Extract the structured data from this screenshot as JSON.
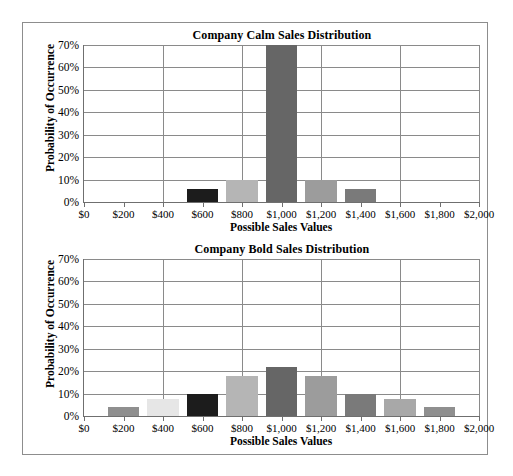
{
  "figure": {
    "background": "#ffffff",
    "frame_color": "#8d8d8d"
  },
  "charts": [
    {
      "id": "company-calm",
      "chart_data": {
        "type": "bar",
        "title": "Company Calm Sales Distribution",
        "xlabel": "Possible Sales Values",
        "ylabel": "Probability of Occurrence",
        "categories": [
          "$0",
          "$200",
          "$400",
          "$600",
          "$800",
          "$1,000",
          "$1,200",
          "$1,400",
          "$1,600",
          "$1,800",
          "$2,000"
        ],
        "x_values": [
          0,
          200,
          400,
          600,
          800,
          1000,
          1200,
          1400,
          1600,
          1800,
          2000
        ],
        "values": [
          0,
          0,
          0,
          0.06,
          0.1,
          0.7,
          0.1,
          0.06,
          0,
          0,
          0
        ],
        "value_labels": [
          "0%",
          "0%",
          "0%",
          "6%",
          "10%",
          "70%",
          "10%",
          "6%",
          "0%",
          "0%",
          "0%"
        ],
        "bar_colors": [
          "",
          "",
          "",
          "#1c1c1c",
          "#b5b5b5",
          "#666666",
          "#9c9c9c",
          "#7a7a7a",
          "",
          "",
          ""
        ],
        "ylim": [
          0,
          0.7
        ],
        "ytick_labels": [
          "0%",
          "10%",
          "20%",
          "30%",
          "40%",
          "50%",
          "60%",
          "70%"
        ],
        "ytick_values": [
          0,
          0.1,
          0.2,
          0.3,
          0.4,
          0.5,
          0.6,
          0.7
        ],
        "grid": true,
        "legend": "none"
      }
    },
    {
      "id": "company-bold",
      "chart_data": {
        "type": "bar",
        "title": "Company Bold Sales Distribution",
        "xlabel": "Possible Sales Values",
        "ylabel": "Probability of Occurrence",
        "categories": [
          "$0",
          "$200",
          "$400",
          "$600",
          "$800",
          "$1,000",
          "$1,200",
          "$1,400",
          "$1,600",
          "$1,800",
          "$2,000"
        ],
        "x_values": [
          0,
          200,
          400,
          600,
          800,
          1000,
          1200,
          1400,
          1600,
          1800,
          2000
        ],
        "values": [
          0,
          0.04,
          0.075,
          0.1,
          0.18,
          0.22,
          0.18,
          0.1,
          0.075,
          0.04,
          0
        ],
        "value_labels": [
          "0%",
          "4%",
          "7.5%",
          "10%",
          "18%",
          "22%",
          "18%",
          "10%",
          "7.5%",
          "4%",
          "0%"
        ],
        "bar_colors": [
          "",
          "#8f8f8f",
          "#e6e6e6",
          "#1c1c1c",
          "#b5b5b5",
          "#666666",
          "#9c9c9c",
          "#7a7a7a",
          "#a8a8a8",
          "#8f8f8f",
          ""
        ],
        "ylim": [
          0,
          0.7
        ],
        "ytick_labels": [
          "0%",
          "10%",
          "20%",
          "30%",
          "40%",
          "50%",
          "60%",
          "70%"
        ],
        "ytick_values": [
          0,
          0.1,
          0.2,
          0.3,
          0.4,
          0.5,
          0.6,
          0.7
        ],
        "grid": true,
        "legend": "none"
      }
    }
  ]
}
